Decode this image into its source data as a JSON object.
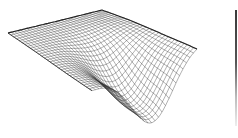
{
  "chart_data": {
    "type": "surface-wireframe",
    "title": "",
    "xlabel": "",
    "ylabel": "",
    "zlabel": "",
    "grid": false,
    "legend": null,
    "projection_corners_px": {
      "back_left": [
        8,
        33
      ],
      "back": [
        102,
        10
      ],
      "right": [
        197,
        44
      ],
      "front": [
        92,
        90
      ],
      "funnel_bottom": [
        108,
        132
      ]
    },
    "mesh": {
      "rows": 30,
      "cols": 30
    },
    "line_color": "#333333",
    "background": "#ffffff"
  },
  "edge_bar": {
    "color": "#3a3a3a"
  }
}
